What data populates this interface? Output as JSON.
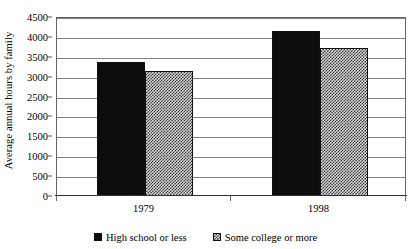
{
  "chart_data": {
    "type": "bar",
    "title": "",
    "subtitle": "",
    "xlabel": "",
    "ylabel": "Average annual hours by family",
    "categories": [
      "1979",
      "1998"
    ],
    "series": [
      {
        "name": "High school or less",
        "fill": "solid-black",
        "color": "#0d0d0d",
        "values": [
          3370,
          4150
        ]
      },
      {
        "name": "Some college or more",
        "fill": "crosshatch-gray",
        "color": "#c8c8c8",
        "values": [
          3140,
          3720
        ]
      }
    ],
    "ylim": [
      0,
      4500
    ],
    "ytick_step": 500,
    "yticks": [
      0,
      500,
      1000,
      1500,
      2000,
      2500,
      3000,
      3500,
      4000,
      4500
    ],
    "ytick_labels": [
      "0",
      "500",
      "1000",
      "1500",
      "2000",
      "2500",
      "3000",
      "3500",
      "4000",
      "4500"
    ],
    "grid": "horizontal",
    "legend_position": "bottom",
    "plot_background": "#ffffff",
    "gridline_color": "#808080",
    "axis_color": "#666666"
  },
  "legend": {
    "items": [
      {
        "label": "High school or less"
      },
      {
        "label": "Some college or more"
      }
    ]
  }
}
